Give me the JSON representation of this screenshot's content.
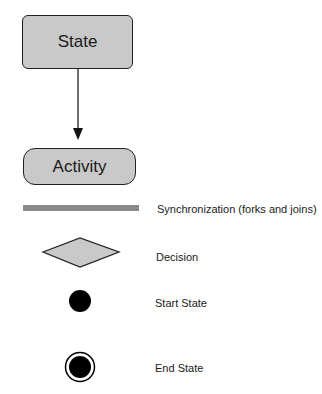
{
  "diagram": {
    "state": {
      "label": "State"
    },
    "activity": {
      "label": "Activity"
    },
    "transition": {
      "from": "State",
      "to": "Activity",
      "arrow": "arrow-down-icon"
    },
    "legend": [
      {
        "symbol": "synchronization-bar",
        "label": "Synchronization (forks and joins)"
      },
      {
        "symbol": "decision-diamond",
        "label": "Decision"
      },
      {
        "symbol": "start-state-circle",
        "label": "Start State"
      },
      {
        "symbol": "end-state-bullseye",
        "label": "End State"
      }
    ],
    "colors": {
      "shape_fill": "#c9c9c9",
      "shape_border": "#222222",
      "sync_bar": "#8a8a8a",
      "start_end_fill": "#000000"
    }
  }
}
